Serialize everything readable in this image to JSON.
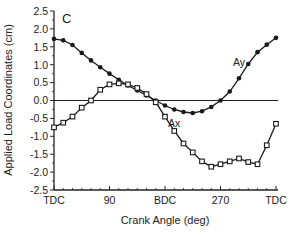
{
  "chart_data": {
    "type": "line",
    "title": "",
    "panel_label": "C",
    "xlabel": "Crank Angle (deg)",
    "ylabel": "Applied Load Coordinates (cm)",
    "xlim": [
      0,
      360
    ],
    "ylim": [
      -2.5,
      2.5
    ],
    "x_ticks": [
      {
        "value": 0,
        "label": "TDC"
      },
      {
        "value": 90,
        "label": "90"
      },
      {
        "value": 180,
        "label": "BDC"
      },
      {
        "value": 270,
        "label": "270"
      },
      {
        "value": 360,
        "label": "TDC"
      }
    ],
    "y_ticks": [
      2.5,
      2.0,
      1.5,
      1.0,
      0.5,
      0.0,
      -0.5,
      -1.0,
      -1.5,
      -2.0,
      -2.5
    ],
    "y_tick_labels": [
      "2.5",
      "2.0",
      "1.5",
      "1.0",
      "0.5",
      "0.0",
      "-0.5",
      "-1.0",
      "-1.5",
      "-2.0",
      "-2.5"
    ],
    "grid": false,
    "zero_line": true,
    "legend": "inline labels",
    "x": [
      0,
      15,
      30,
      45,
      60,
      75,
      90,
      105,
      120,
      135,
      150,
      165,
      180,
      195,
      210,
      225,
      240,
      255,
      270,
      285,
      300,
      315,
      330,
      345,
      360
    ],
    "series": [
      {
        "name": "Ay",
        "marker": "filled-circle",
        "label_pos": {
          "x": 300,
          "y": 0.95
        },
        "values": [
          1.72,
          1.68,
          1.55,
          1.33,
          1.12,
          0.93,
          0.75,
          0.58,
          0.42,
          0.28,
          0.14,
          0.0,
          -0.14,
          -0.25,
          -0.32,
          -0.35,
          -0.3,
          -0.18,
          0.0,
          0.25,
          0.62,
          1.02,
          1.35,
          1.56,
          1.75
        ]
      },
      {
        "name": "Ax",
        "marker": "open-square",
        "label_pos": {
          "x": 195,
          "y": -0.75
        },
        "values": [
          -0.75,
          -0.62,
          -0.45,
          -0.2,
          0.0,
          0.3,
          0.45,
          0.48,
          0.45,
          0.35,
          0.18,
          -0.05,
          -0.45,
          -0.85,
          -1.2,
          -1.45,
          -1.7,
          -1.85,
          -1.78,
          -1.7,
          -1.62,
          -1.72,
          -1.78,
          -1.25,
          -0.65
        ]
      }
    ]
  }
}
